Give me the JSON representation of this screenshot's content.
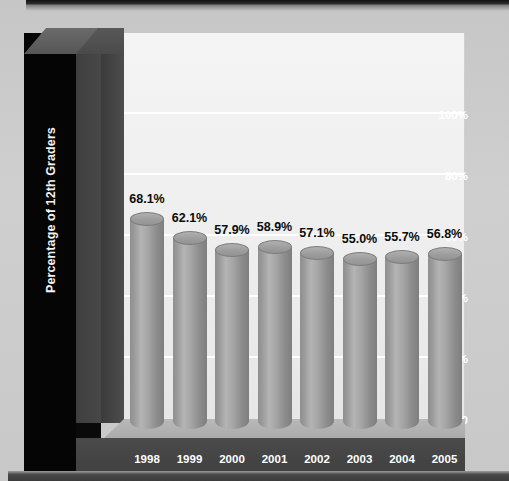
{
  "chart_data": {
    "type": "bar",
    "title": "",
    "xlabel": "",
    "ylabel": "Percentage of 12th Graders",
    "categories": [
      "1998",
      "1999",
      "2000",
      "2001",
      "2002",
      "2003",
      "2004",
      "2005"
    ],
    "values": [
      68.1,
      62.1,
      57.9,
      58.9,
      57.1,
      55.0,
      55.7,
      56.8
    ],
    "value_labels": [
      "68.1%",
      "62.1%",
      "57.9%",
      "58.9%",
      "57.1%",
      "55.0%",
      "55.7%",
      "56.8%"
    ],
    "ylim": [
      0,
      120
    ],
    "yticks": [
      0,
      20,
      40,
      60,
      80,
      100
    ],
    "ytick_labels": [
      "0",
      "20%",
      "40%",
      "60%",
      "80%",
      "100%"
    ],
    "grid": true,
    "legend": "none",
    "style": "3d-cylinder"
  },
  "colors": {
    "page_background": "#c9c9c9",
    "plot_background": "#eeeeee",
    "gridline": "#ffffff",
    "wall_dark": "#050505",
    "wall_mid": "#454545",
    "floor": "#434343",
    "bar": "#9d9d9d",
    "bar_highlight": "#b4b4b4",
    "label_text": "#0c0c0c",
    "axis_text": "#ffffff"
  }
}
